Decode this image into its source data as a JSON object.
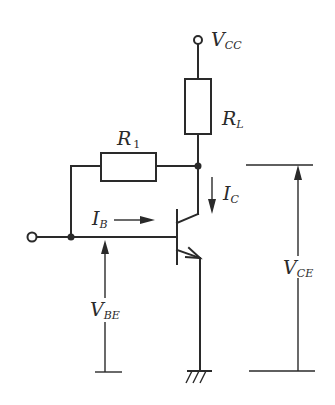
{
  "diagram": {
    "type": "circuit",
    "title": "",
    "colors": {
      "ink": "#2a2a2a",
      "background": "#ffffff"
    },
    "labels": {
      "vcc": {
        "main": "V",
        "sub": "CC"
      },
      "rl": {
        "main": "R",
        "sub": "L"
      },
      "r1": {
        "main": "R",
        "sub": "1"
      },
      "ic": {
        "main": "I",
        "sub": "C"
      },
      "ib": {
        "main": "I",
        "sub": "B"
      },
      "vbe": {
        "main": "V",
        "sub": "BE"
      },
      "vce": {
        "main": "V",
        "sub": "CE"
      }
    },
    "components": [
      {
        "id": "vcc-terminal",
        "kind": "terminal",
        "label": "VCC"
      },
      {
        "id": "rl",
        "kind": "resistor",
        "label": "RL"
      },
      {
        "id": "r1",
        "kind": "resistor",
        "label": "R1",
        "role": "feedback collector-to-base"
      },
      {
        "id": "q1",
        "kind": "npn-transistor"
      },
      {
        "id": "input-terminal",
        "kind": "terminal"
      },
      {
        "id": "ground",
        "kind": "ground"
      }
    ]
  }
}
